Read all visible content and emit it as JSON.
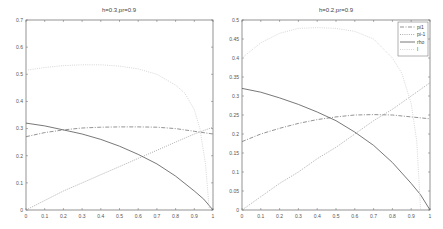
{
  "chart_data": [
    {
      "type": "line",
      "title": "h=0.3,pr=0.9",
      "xlabel": "",
      "ylabel": "",
      "xlim": [
        0,
        1
      ],
      "ylim": [
        0,
        0.7
      ],
      "xticks": [
        0,
        0.1,
        0.2,
        0.3,
        0.4,
        0.5,
        0.6,
        0.7,
        0.8,
        0.9,
        1
      ],
      "xtick_labels": [
        "0",
        "0.1",
        "0.2",
        "0.3",
        "0.4",
        "0.5",
        "0.6",
        "0.7",
        "0.8",
        "0.9",
        "1"
      ],
      "yticks": [
        0,
        0.1,
        0.2,
        0.3,
        0.4,
        0.5,
        0.6,
        0.7
      ],
      "ytick_labels": [
        "0",
        "0.1",
        "0.2",
        "0.3",
        "0.4",
        "0.5",
        "0.6",
        "0.7"
      ],
      "grid": false,
      "legend": null,
      "box": {
        "x0": 26,
        "x1": 213,
        "y0": 20,
        "y1": 210
      },
      "series": [
        {
          "name": "pi1",
          "style": "dashdot",
          "color": "#777777",
          "x": [
            0,
            0.1,
            0.2,
            0.3,
            0.4,
            0.5,
            0.6,
            0.7,
            0.8,
            0.9,
            1
          ],
          "values": [
            0.27,
            0.285,
            0.295,
            0.302,
            0.305,
            0.306,
            0.306,
            0.305,
            0.3,
            0.29,
            0.28
          ]
        },
        {
          "name": "pi-1",
          "style": "dotted",
          "color": "#999999",
          "x": [
            0,
            0.1,
            0.2,
            0.3,
            0.4,
            0.5,
            0.6,
            0.7,
            0.8,
            0.9,
            1
          ],
          "values": [
            0,
            0.035,
            0.07,
            0.1,
            0.13,
            0.16,
            0.19,
            0.22,
            0.25,
            0.28,
            0.305
          ]
        },
        {
          "name": "rho",
          "style": "solid",
          "color": "#555555",
          "x": [
            0,
            0.1,
            0.2,
            0.3,
            0.4,
            0.5,
            0.6,
            0.7,
            0.8,
            0.9,
            0.95,
            1
          ],
          "values": [
            0.32,
            0.31,
            0.295,
            0.28,
            0.26,
            0.235,
            0.205,
            0.17,
            0.125,
            0.07,
            0.04,
            0
          ]
        },
        {
          "name": "l",
          "style": "dotted",
          "color": "#cccccc",
          "x": [
            0,
            0.1,
            0.2,
            0.3,
            0.4,
            0.5,
            0.6,
            0.7,
            0.8,
            0.85,
            0.9,
            0.93,
            0.96,
            0.98
          ],
          "values": [
            0.515,
            0.525,
            0.532,
            0.535,
            0.535,
            0.53,
            0.52,
            0.5,
            0.46,
            0.43,
            0.37,
            0.3,
            0.17,
            0.0
          ]
        }
      ]
    },
    {
      "type": "line",
      "title": "h=0.2,pr=0.9",
      "xlabel": "",
      "ylabel": "",
      "xlim": [
        0,
        1
      ],
      "ylim": [
        0,
        0.5
      ],
      "xticks": [
        0,
        0.1,
        0.2,
        0.3,
        0.4,
        0.5,
        0.6,
        0.7,
        0.8,
        0.9,
        1
      ],
      "xtick_labels": [
        "0",
        "0.1",
        "0.2",
        "0.3",
        "0.4",
        "0.5",
        "0.6",
        "0.7",
        "0.8",
        "0.9",
        "1"
      ],
      "yticks": [
        0,
        0.05,
        0.1,
        0.15,
        0.2,
        0.25,
        0.3,
        0.35,
        0.4,
        0.45,
        0.5
      ],
      "ytick_labels": [
        "0",
        "0.05",
        "0.1",
        "0.15",
        "0.2",
        "0.25",
        "0.3",
        "0.35",
        "0.4",
        "0.45",
        "0.5"
      ],
      "grid": false,
      "legend": {
        "position": "upper right",
        "entries": [
          "pi1",
          "pi-1",
          "rho",
          "l"
        ]
      },
      "box": {
        "x0": 242,
        "x1": 430,
        "y0": 20,
        "y1": 210
      },
      "series": [
        {
          "name": "pi1",
          "style": "dashdot",
          "color": "#777777",
          "x": [
            0,
            0.1,
            0.2,
            0.3,
            0.4,
            0.5,
            0.6,
            0.7,
            0.8,
            0.9,
            1
          ],
          "values": [
            0.18,
            0.2,
            0.215,
            0.228,
            0.238,
            0.245,
            0.25,
            0.251,
            0.25,
            0.245,
            0.24
          ]
        },
        {
          "name": "pi-1",
          "style": "dotted",
          "color": "#999999",
          "x": [
            0,
            0.1,
            0.2,
            0.3,
            0.4,
            0.5,
            0.6,
            0.7,
            0.8,
            0.9,
            1
          ],
          "values": [
            0,
            0.035,
            0.07,
            0.1,
            0.135,
            0.165,
            0.2,
            0.235,
            0.265,
            0.3,
            0.335
          ]
        },
        {
          "name": "rho",
          "style": "solid",
          "color": "#555555",
          "x": [
            0,
            0.1,
            0.2,
            0.3,
            0.4,
            0.5,
            0.6,
            0.7,
            0.8,
            0.9,
            0.95,
            1
          ],
          "values": [
            0.32,
            0.31,
            0.295,
            0.278,
            0.258,
            0.235,
            0.205,
            0.17,
            0.125,
            0.07,
            0.04,
            0
          ]
        },
        {
          "name": "l",
          "style": "dotted",
          "color": "#cccccc",
          "x": [
            0,
            0.1,
            0.2,
            0.3,
            0.4,
            0.5,
            0.6,
            0.7,
            0.8,
            0.85,
            0.9,
            0.93,
            0.95
          ],
          "values": [
            0.4,
            0.44,
            0.465,
            0.478,
            0.48,
            0.478,
            0.47,
            0.45,
            0.4,
            0.36,
            0.28,
            0.18,
            0.0
          ]
        }
      ]
    }
  ]
}
